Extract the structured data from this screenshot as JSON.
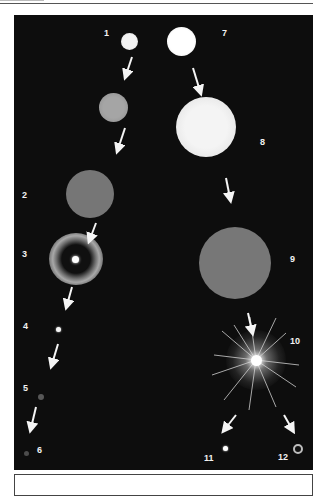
{
  "figure": {
    "title": "",
    "background_color": "#0d0d0d",
    "stages": [
      {
        "id": 1,
        "label": "1",
        "kind": "small star",
        "color": "#e8e8e8"
      },
      {
        "id": 2,
        "label": "2",
        "kind": "red giant",
        "color": "#7a7a7a"
      },
      {
        "id": 3,
        "label": "3",
        "kind": "planetary nebula",
        "color": "#bdbdbd"
      },
      {
        "id": 4,
        "label": "4",
        "kind": "white dwarf",
        "color": "#f5f5f5"
      },
      {
        "id": 5,
        "label": "5",
        "kind": "fading dwarf",
        "color": "#5a5a5a"
      },
      {
        "id": 6,
        "label": "6",
        "kind": "black dwarf",
        "color": "#4a4a4a"
      },
      {
        "id": 7,
        "label": "7",
        "kind": "massive star",
        "color": "#f7f7f7"
      },
      {
        "id": 8,
        "label": "8",
        "kind": "supergiant",
        "color": "#efefef"
      },
      {
        "id": 9,
        "label": "9",
        "kind": "red supergiant",
        "color": "#7a7a7a"
      },
      {
        "id": 10,
        "label": "10",
        "kind": "supernova",
        "color": "#ffffff"
      },
      {
        "id": 11,
        "label": "11",
        "kind": "neutron star",
        "color": "#ffffff"
      },
      {
        "id": 12,
        "label": "12",
        "kind": "black hole",
        "color": "#cfcfcf"
      }
    ],
    "intermediate": {
      "kind": "transitional star",
      "color": "#9a9a9a"
    }
  },
  "caption": {
    "text": ""
  }
}
